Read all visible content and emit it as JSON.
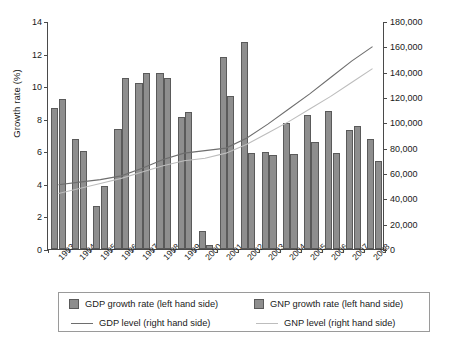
{
  "chart_data": {
    "type": "bar",
    "title": "",
    "xlabel": "",
    "ylabel": "Growth rate (%)",
    "y2label": "Millions in local currency",
    "ylim": [
      0,
      14
    ],
    "y2lim": [
      0,
      180000
    ],
    "yticks": [
      "0",
      "2",
      "4",
      "6",
      "8",
      "10",
      "12",
      "14"
    ],
    "ytick_values": [
      0,
      2,
      4,
      6,
      8,
      10,
      12,
      14
    ],
    "y2ticks": [
      "0",
      "20,000",
      "40,000",
      "60,000",
      "80,000",
      "100,000",
      "120,000",
      "140,000",
      "160,000",
      "180,000"
    ],
    "y2tick_values": [
      0,
      20000,
      40000,
      60000,
      80000,
      100000,
      120000,
      140000,
      160000,
      180000
    ],
    "grid": false,
    "legend_position": "bottom",
    "categories": [
      "1993",
      "1994",
      "1995",
      "1996",
      "1997",
      "1998",
      "1999",
      "2000",
      "2001",
      "2002",
      "2003",
      "2004",
      "2005",
      "2006",
      "2007",
      "2008"
    ],
    "series": [
      {
        "name": "GDP growth rate (left hand side)",
        "kind": "bar",
        "axis": "left",
        "color": "#8e8e8e",
        "values": [
          8.65,
          6.75,
          2.65,
          7.4,
          10.2,
          10.8,
          8.1,
          1.1,
          11.8,
          12.7,
          5.95,
          7.75,
          8.25,
          8.5,
          7.3,
          6.75
        ]
      },
      {
        "name": "GNP growth rate (left hand side)",
        "kind": "bar",
        "axis": "left",
        "color": "#8e8e8e",
        "values": [
          9.2,
          6.0,
          3.85,
          10.5,
          10.8,
          10.5,
          8.4,
          0.25,
          9.4,
          5.9,
          5.8,
          5.85,
          6.6,
          5.9,
          7.55,
          5.4
        ]
      },
      {
        "name": "GDP level (right hand side)",
        "kind": "line",
        "axis": "right",
        "color": "#6e6e6e",
        "values": [
          51000,
          53000,
          55000,
          58000,
          64000,
          71000,
          76000,
          78000,
          80000,
          88000,
          99000,
          111000,
          123000,
          136000,
          149000,
          160500
        ]
      },
      {
        "name": "GNP level (right hand side)",
        "kind": "line",
        "axis": "right",
        "color": "#bdbdbd",
        "values": [
          44000,
          48000,
          52000,
          56000,
          61000,
          66000,
          70000,
          72000,
          76000,
          83000,
          92000,
          101000,
          111000,
          121000,
          132000,
          143000
        ]
      }
    ]
  },
  "legend": {
    "entries": [
      {
        "label": "GDP growth rate (left hand side)",
        "marker": "swatch",
        "color": "#8e8e8e"
      },
      {
        "label": "GNP growth rate (left hand side)",
        "marker": "swatch",
        "color": "#8e8e8e"
      },
      {
        "label": "GDP level (right hand side)",
        "marker": "line",
        "color": "#6e6e6e"
      },
      {
        "label": "GNP level (right hand side)",
        "marker": "line",
        "color": "#bdbdbd"
      }
    ]
  }
}
